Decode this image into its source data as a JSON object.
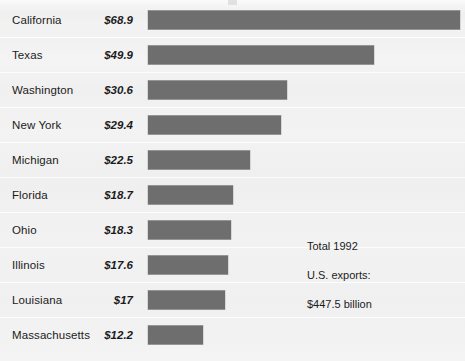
{
  "chart_data": {
    "type": "bar",
    "orientation": "horizontal",
    "title": "",
    "xlabel": "",
    "ylabel": "",
    "value_prefix": "$",
    "value_unit": "billion",
    "categories": [
      "California",
      "Texas",
      "Washington",
      "New York",
      "Michigan",
      "Florida",
      "Ohio",
      "Illinois",
      "Louisiana",
      "Massachusetts"
    ],
    "values": [
      68.9,
      49.9,
      30.6,
      29.4,
      22.5,
      18.7,
      18.3,
      17.6,
      17,
      12.2
    ],
    "value_labels": [
      "$68.9",
      "$49.9",
      "$30.6",
      "$29.4",
      "$22.5",
      "$18.7",
      "$18.3",
      "$17.6",
      "$17",
      "$12.2"
    ],
    "xlim": [
      0,
      69
    ],
    "grid": false,
    "legend": false,
    "bar_color": "#6e6e6e",
    "background_color": "#f2f2f2",
    "text_color": "#1b1b1b"
  },
  "rows": [
    {
      "label": "California",
      "value_label": "$68.9",
      "value": 68.9
    },
    {
      "label": "Texas",
      "value_label": "$49.9",
      "value": 49.9
    },
    {
      "label": "Washington",
      "value_label": "$30.6",
      "value": 30.6
    },
    {
      "label": "New York",
      "value_label": "$29.4",
      "value": 29.4
    },
    {
      "label": "Michigan",
      "value_label": "$22.5",
      "value": 22.5
    },
    {
      "label": "Florida",
      "value_label": "$18.7",
      "value": 18.7
    },
    {
      "label": "Ohio",
      "value_label": "$18.3",
      "value": 18.3
    },
    {
      "label": "Illinois",
      "value_label": "$17.6",
      "value": 17.6
    },
    {
      "label": "Louisiana",
      "value_label": "$17",
      "value": 17
    },
    {
      "label": "Massachusetts",
      "value_label": "$12.2",
      "value": 12.2
    }
  ],
  "annotation": {
    "line1": "Total 1992",
    "line2": "U.S. exports:",
    "line3": "$447.5 billion"
  }
}
